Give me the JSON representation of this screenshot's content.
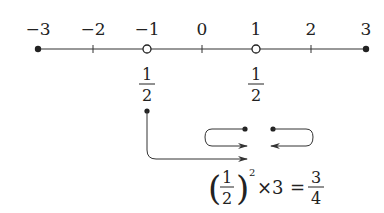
{
  "number_line": {
    "ticks": [
      {
        "label": "−3",
        "value": -3,
        "marker": "filled-dot"
      },
      {
        "label": "−2",
        "value": -2,
        "marker": "tick"
      },
      {
        "label": "−1",
        "value": -1,
        "marker": "open-circle"
      },
      {
        "label": "0",
        "value": 0,
        "marker": "tick"
      },
      {
        "label": "1",
        "value": 1,
        "marker": "open-circle"
      },
      {
        "label": "2",
        "value": 2,
        "marker": "tick"
      },
      {
        "label": "3",
        "value": 3,
        "marker": "filled-dot"
      }
    ],
    "below_labels": [
      {
        "at": -1,
        "numerator": "1",
        "denominator": "2"
      },
      {
        "at": 1,
        "numerator": "1",
        "denominator": "2"
      }
    ]
  },
  "equation": {
    "base_numerator": "1",
    "base_denominator": "2",
    "exponent": "2",
    "times": "×3",
    "equals": "=",
    "result_numerator": "3",
    "result_denominator": "4"
  },
  "colors": {
    "ink": "#222222",
    "background": "#ffffff"
  }
}
